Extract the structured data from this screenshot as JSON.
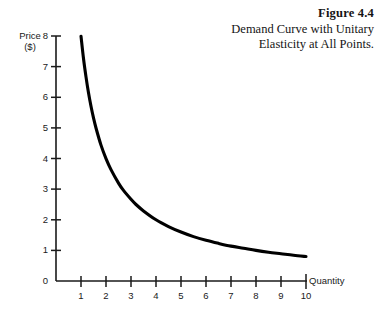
{
  "caption": {
    "figure_number": "Figure 4.4",
    "title": "Demand Curve with Unitary Elasticity at All Points."
  },
  "axes": {
    "ylabel_line1": "Price",
    "ylabel_line2": "($)",
    "xlabel": "Quantity"
  },
  "chart_data": {
    "type": "line",
    "title": "Demand Curve with Unitary Elasticity at All Points.",
    "subtitle": "Figure 4.4",
    "xlabel": "Quantity",
    "ylabel": "Price ($)",
    "xlim": [
      0,
      10.4
    ],
    "ylim": [
      0,
      8.4
    ],
    "xticks": [
      1,
      2,
      3,
      4,
      5,
      6,
      7,
      8,
      9,
      10
    ],
    "xtick_labels": [
      "1",
      "2",
      "3",
      "4",
      "5",
      "6",
      "7",
      "8",
      "9",
      "10"
    ],
    "yticks": [
      0,
      1,
      2,
      3,
      4,
      5,
      6,
      7,
      8
    ],
    "ytick_labels": [
      "0",
      "1",
      "2",
      "3",
      "4",
      "5",
      "6",
      "7",
      "8"
    ],
    "grid": false,
    "legend": false,
    "relation": "P = 8 / Q",
    "series": [
      {
        "name": "Demand",
        "color": "#000000",
        "x": [
          1.0,
          1.1,
          1.2,
          1.3,
          1.4,
          1.5,
          1.6,
          1.8,
          2.0,
          2.2,
          2.5,
          2.7,
          3.0,
          3.2,
          3.5,
          4.0,
          4.5,
          5.0,
          5.5,
          6.0,
          6.5,
          7.0,
          7.5,
          8.0,
          8.5,
          9.0,
          9.5,
          10.0
        ],
        "y": [
          8.0,
          7.27,
          6.67,
          6.15,
          5.71,
          5.33,
          5.0,
          4.44,
          4.0,
          3.64,
          3.2,
          2.96,
          2.67,
          2.5,
          2.29,
          2.0,
          1.78,
          1.6,
          1.45,
          1.33,
          1.23,
          1.14,
          1.07,
          1.0,
          0.94,
          0.89,
          0.84,
          0.8
        ]
      }
    ]
  },
  "colors": {
    "curve": "#000000",
    "axis": "#1a1a1a",
    "background": "#ffffff"
  }
}
